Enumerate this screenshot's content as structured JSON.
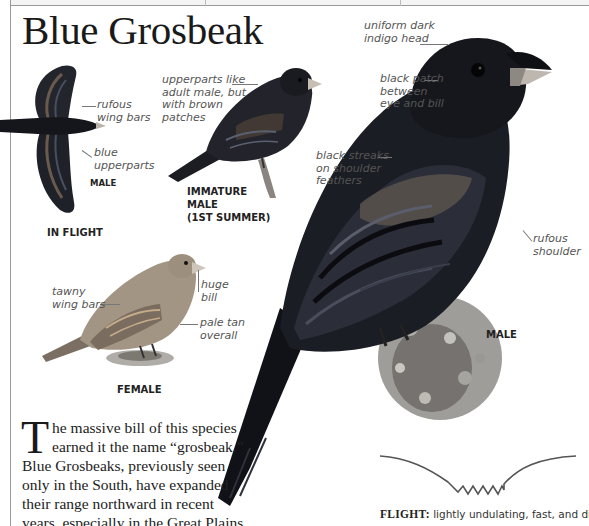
{
  "page": {
    "title": "Blue Grosbeak"
  },
  "figures": {
    "in_flight": {
      "sex_label": "MALE",
      "caption": "IN FLIGHT",
      "annotations": [
        "rufous\nwing bars",
        "blue\nupperparts"
      ]
    },
    "immature_male": {
      "caption": "IMMATURE\nMALE\n(1ST SUMMER)",
      "annotations": [
        "upperparts like\nadult male, but\nwith brown\npatches"
      ]
    },
    "female": {
      "caption": "FEMALE",
      "annotations": [
        "tawny\nwing bars",
        "huge\nbill",
        "pale tan\noverall"
      ]
    },
    "male": {
      "caption": "MALE",
      "annotations": [
        "uniform dark\nindigo head",
        "black patch\nbetween\neye and bill",
        "black streaks\non shoulder\nfeathers",
        "rufous\nshoulder"
      ]
    }
  },
  "description": {
    "dropcap": "T",
    "text": "he massive bill of this species earned it the name “grosbeak.” Blue Grosbeaks, previously seen only in the South, have expanded their range northward in recent years, especially in the Great Plains."
  },
  "flight": {
    "label": "FLIGHT:",
    "text": " lightly undulating, fast, and direct."
  },
  "colors": {
    "male_body": "#1b1d24",
    "female_body": "#9a8a78",
    "rule": "#9a9a9a",
    "annotation_text": "#555555"
  }
}
